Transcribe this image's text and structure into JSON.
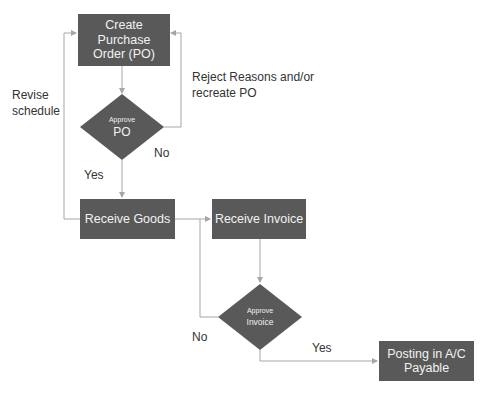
{
  "nodes": {
    "create_po": {
      "label": "Create Purchase Order (PO)",
      "shape": "rectangle"
    },
    "approve_po": {
      "label_small": "Approve",
      "label_big": "PO",
      "shape": "diamond"
    },
    "receive_goods": {
      "label": "Receive Goods",
      "shape": "rectangle"
    },
    "receive_invoice": {
      "label": "Receive Invoice",
      "shape": "rectangle"
    },
    "approve_invoice": {
      "label_small": "Approve",
      "label_big": "Invoice",
      "shape": "diamond"
    },
    "posting": {
      "label": "Posting in A/C Payable",
      "shape": "rectangle"
    }
  },
  "edge_labels": {
    "revise": "Revise schedule",
    "reject": "Reject Reasons and/or recreate PO",
    "po_no": "No",
    "po_yes": "Yes",
    "inv_no": "No",
    "inv_yes": "Yes"
  },
  "colors": {
    "node_fill": "#595959",
    "node_text": "#f2f2f2",
    "edge": "#a6a6a6",
    "label_text": "#333333"
  }
}
